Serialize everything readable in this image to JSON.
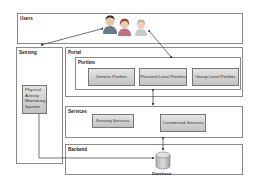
{
  "diagram": {
    "layers": {
      "users": {
        "label": "Users"
      },
      "sensing": {
        "label": "Sensing",
        "component": "Physical Activity Monitoring System"
      },
      "portal": {
        "label": "Portal",
        "portlets": {
          "label": "Portlets",
          "items": [
            "Generic Portlets",
            "Personal Level Portlets",
            "Group Level Portlets"
          ]
        }
      },
      "services": {
        "label": "Services",
        "items": [
          "Existing Services",
          "Customised Services"
        ]
      },
      "backend": {
        "label": "Backend",
        "database": "Database"
      }
    },
    "colors": {
      "box_border": "#8a8a8a",
      "component_fill": "#cfcfcf",
      "arrow": "#333333"
    }
  }
}
